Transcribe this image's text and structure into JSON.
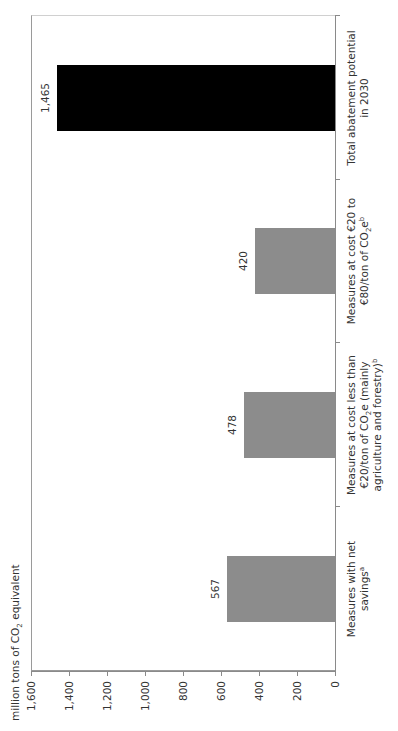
{
  "chart_data": {
    "type": "bar",
    "orientation": "vertical (figure rotated 90 degrees on page)",
    "title": "",
    "ylabel": "million tons of CO2 equivalent",
    "xlabel": "",
    "categories": [
      "Measures with net savings^a",
      "Measures at cost less than €20/ton of CO2e (mainly agriculture and forestry)^b",
      "Measures at cost €20 to €80/ton of CO2e^b",
      "Total abatement potential in 2030"
    ],
    "values": [
      567,
      478,
      420,
      1465
    ],
    "value_labels": [
      "567",
      "478",
      "420",
      "1,465"
    ],
    "bar_colors": [
      "#8c8c8c",
      "#8c8c8c",
      "#8c8c8c",
      "#000000"
    ],
    "ylim": [
      0,
      1600
    ],
    "yticks": [
      0,
      200,
      400,
      600,
      800,
      1000,
      1200,
      1400,
      1600
    ],
    "ytick_labels": [
      "0",
      "200",
      "400",
      "600",
      "800",
      "1,000",
      "1,200",
      "1,400",
      "1,600"
    ],
    "grid": false,
    "legend": null
  },
  "axis": {
    "title_prefix": "million tons of CO",
    "title_sub": "2",
    "title_suffix": " equivalent",
    "ticks": [
      "0",
      "200",
      "400",
      "600",
      "800",
      "1,000",
      "1,200",
      "1,400",
      "1,600"
    ]
  },
  "bars": [
    {
      "value_label": "567",
      "color": "#8c8c8c",
      "label_lines": [
        {
          "text": "Measures with net"
        },
        {
          "text": "savings",
          "sup": "a"
        }
      ]
    },
    {
      "value_label": "478",
      "color": "#8c8c8c",
      "label_lines": [
        {
          "text": "Measures at cost less than"
        },
        {
          "text": "€20/ton of CO",
          "sub": "2",
          "after": "e (mainly"
        },
        {
          "text": "agriculture and forestry)",
          "sup": "b"
        }
      ]
    },
    {
      "value_label": "420",
      "color": "#8c8c8c",
      "label_lines": [
        {
          "text": "Measures at cost €20 to"
        },
        {
          "text": "€80/ton of CO",
          "sub": "2",
          "after": "e",
          "sup": "b"
        }
      ]
    },
    {
      "value_label": "1,465",
      "color": "#000000",
      "label_lines": [
        {
          "text": "Total abatement potential"
        },
        {
          "text": "in 2030"
        }
      ]
    }
  ]
}
